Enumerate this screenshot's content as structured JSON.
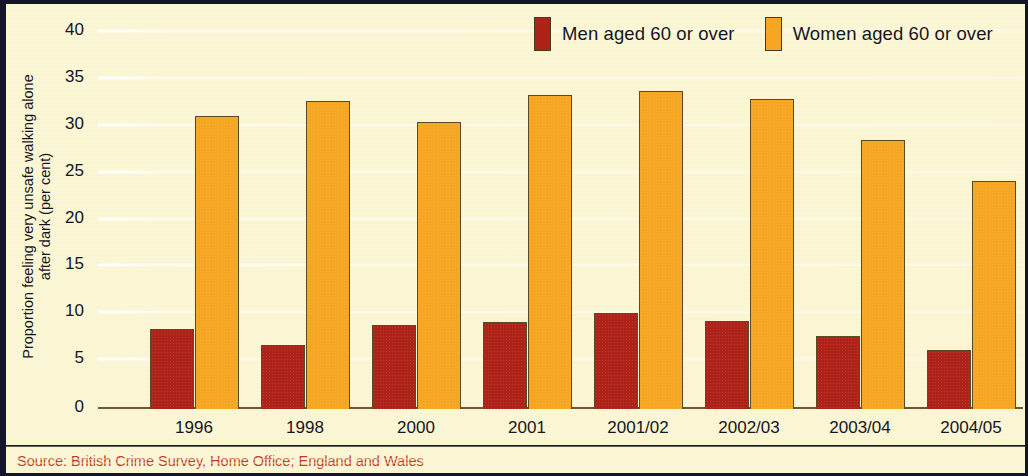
{
  "chart_data": {
    "type": "bar",
    "title": "",
    "xlabel": "",
    "ylabel": "Proportion feeling very unsafe walking alone after dark (per cent)",
    "ylabel_line1": "Proportion feeling very unsafe walking alone",
    "ylabel_line2": "after dark (per cent)",
    "categories": [
      "1996",
      "1998",
      "2000",
      "2001",
      "2001/02",
      "2002/03",
      "2003/04",
      "2004/05"
    ],
    "series": [
      {
        "name": "Men aged 60 or over",
        "color": "#ae2318",
        "values": [
          8.5,
          6.8,
          9.0,
          9.3,
          10.2,
          9.4,
          7.8,
          6.3
        ]
      },
      {
        "name": "Women aged 60 or over",
        "color": "#f5a623",
        "values": [
          31.3,
          32.9,
          30.6,
          33.5,
          33.9,
          33.1,
          28.7,
          24.3
        ]
      }
    ],
    "ylim": [
      0,
      40
    ],
    "yticks": [
      0,
      5,
      10,
      15,
      20,
      25,
      30,
      35,
      40
    ],
    "ytick_labels": [
      "0",
      "5",
      "10",
      "15",
      "20",
      "25",
      "30",
      "35",
      "40"
    ],
    "grid": true,
    "legend_position": "top-right"
  },
  "legend": {
    "entries": [
      {
        "label": "Men aged 60 or over",
        "swatch": "men-swatch"
      },
      {
        "label": "Women aged 60 or over",
        "swatch": "women-swatch"
      }
    ]
  },
  "source": {
    "text": "Source: British Crime Survey, Home Office; England and Wales"
  },
  "colors": {
    "men": "#ae2318",
    "women": "#f5a623",
    "background": "#fbf6d5",
    "frame": "#14142a",
    "source_text": "#c0392b",
    "axis_text": "#15151f"
  }
}
